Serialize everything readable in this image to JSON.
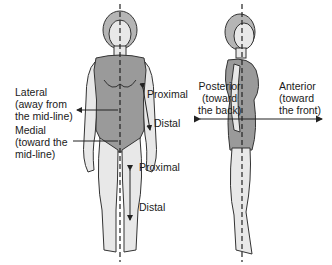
{
  "labels": {
    "lateral": "Lateral\n(away from\nthe mid-line)",
    "medial": "Medial\n(toward the\nmid-line)",
    "proximal_arm": "Proximal",
    "distal_arm": "Distal",
    "proximal_leg": "Proximal",
    "distal_leg": "Distal",
    "posterior": "Posterior\n(toward\nthe back)",
    "anterior": "Anterior\n(toward\nthe front)"
  },
  "colors": {
    "skin": "#e8e8e8",
    "swimsuit": "#9a9a9a",
    "hair": "#b5b5b5",
    "outline": "#333333"
  }
}
